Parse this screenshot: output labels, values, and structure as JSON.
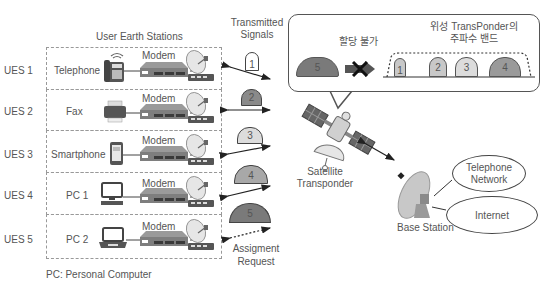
{
  "headers": {
    "user_earth_stations": "User Earth Stations",
    "transmitted_signals_line1": "Transmitted",
    "transmitted_signals_line2": "Signals"
  },
  "stations": [
    {
      "id": "UES 1",
      "device": "Telephone",
      "modem": "Modem",
      "icon": "telephone-icon"
    },
    {
      "id": "UES 2",
      "device": "Fax",
      "modem": "Modem",
      "icon": "fax-icon"
    },
    {
      "id": "UES 3",
      "device": "Smartphone",
      "modem": "Modem",
      "icon": "smartphone-icon"
    },
    {
      "id": "UES 4",
      "device": "PC 1",
      "modem": "Modem",
      "icon": "desktop-pc-icon"
    },
    {
      "id": "UES 5",
      "device": "PC 2",
      "modem": "Modem",
      "icon": "laptop-icon"
    }
  ],
  "signals": [
    {
      "label": "1",
      "color": "#c8c8c8"
    },
    {
      "label": "2",
      "color": "#8a8a8a"
    },
    {
      "label": "3",
      "color": "#dcdcdc"
    },
    {
      "label": "4",
      "color": "#a8a8a8"
    },
    {
      "label": "5",
      "color": "#7a7a7a"
    }
  ],
  "assignment_request": {
    "line1": "Assigment",
    "line2": "Request"
  },
  "callout": {
    "not_assignable": "할당 불가",
    "band_title_line1": "위성 TransPonder의",
    "band_title_line2": "주파수 밴드",
    "rejected_signal": "5",
    "bands": [
      {
        "label": "1",
        "color": "#c8c8c8"
      },
      {
        "label": "2",
        "color": "#c8c8c8"
      },
      {
        "label": "3",
        "color": "#dcdcdc"
      },
      {
        "label": "4",
        "color": "#9a9a9a"
      }
    ]
  },
  "satellite": {
    "line1": "Satellite",
    "line2": "Transponder"
  },
  "base_station": {
    "label": "Base Station"
  },
  "networks": {
    "telephone_line1": "Telephone",
    "telephone_line2": "Network",
    "internet": "Internet"
  },
  "footnote": "PC: Personal Computer"
}
